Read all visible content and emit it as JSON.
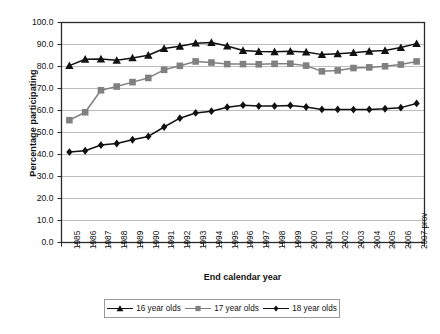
{
  "chart_data": {
    "type": "line",
    "title": "",
    "xlabel": "End calendar year",
    "ylabel": "Percentage participating",
    "ylim": [
      0.0,
      100.0
    ],
    "y_ticks": [
      "0.0",
      "10.0",
      "20.0",
      "30.0",
      "40.0",
      "50.0",
      "60.0",
      "70.0",
      "80.0",
      "90.0",
      "100.0"
    ],
    "grid": "horizontal",
    "legend_position": "bottom",
    "categories": [
      "1985",
      "1986",
      "1987",
      "1988",
      "1989",
      "1990",
      "1991",
      "1992",
      "1993",
      "1994",
      "1995",
      "1996",
      "1997",
      "1998",
      "1999",
      "2000",
      "2001",
      "2002",
      "2003",
      "2004",
      "2005",
      "2006",
      "2007 prov"
    ],
    "series": [
      {
        "name": "16 year olds",
        "color": "#111111",
        "marker": "triangle",
        "values": [
          80.4,
          83.3,
          83.4,
          82.8,
          83.9,
          85.1,
          88.2,
          89.2,
          90.6,
          90.9,
          89.3,
          87.3,
          86.8,
          86.7,
          86.9,
          86.6,
          85.4,
          85.8,
          86.3,
          86.9,
          87.3,
          88.6,
          90.4
        ]
      },
      {
        "name": "17 year olds",
        "color": "#808080",
        "marker": "square",
        "values": [
          55.6,
          59.2,
          69.2,
          70.9,
          72.9,
          74.8,
          78.5,
          80.3,
          82.3,
          81.8,
          81.1,
          81.1,
          81.0,
          81.2,
          81.3,
          80.4,
          77.8,
          78.2,
          79.3,
          79.6,
          80.1,
          80.9,
          82.3
        ]
      },
      {
        "name": "18 year olds",
        "color": "#111111",
        "marker": "diamond",
        "values": [
          41.1,
          41.7,
          44.3,
          45.0,
          46.7,
          48.2,
          52.5,
          56.5,
          58.9,
          59.7,
          61.5,
          62.4,
          62.0,
          62.0,
          62.3,
          61.6,
          60.5,
          60.5,
          60.4,
          60.5,
          60.8,
          61.3,
          63.2
        ]
      }
    ]
  }
}
